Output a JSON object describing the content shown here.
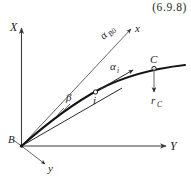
{
  "figure": {
    "equation_number": "(6.9.8)",
    "axes": [
      {
        "id": "X",
        "label": "X",
        "direction": "up",
        "type": "global"
      },
      {
        "id": "Y",
        "label": "Y",
        "direction": "right",
        "type": "global"
      },
      {
        "id": "y",
        "label": "y",
        "direction": "down-right",
        "type": "local"
      },
      {
        "id": "x",
        "label": "x",
        "direction": "up-right",
        "type": "local"
      }
    ],
    "points": [
      {
        "id": "B",
        "label": "B",
        "role": "origin"
      },
      {
        "id": "i",
        "label": "i",
        "role": "intermediate-node"
      },
      {
        "id": "C",
        "label": "C",
        "role": "end-node"
      }
    ],
    "angles": [
      {
        "id": "alpha_B0",
        "label": "α",
        "subscript": "B0",
        "between": "X-axis and local x-axis"
      },
      {
        "id": "beta",
        "label": "β",
        "subscript": "",
        "between": "local x-axis and chord B-i"
      },
      {
        "id": "alpha_i",
        "label": "α",
        "subscript": "i",
        "between": "tangent at i and local x-axis"
      }
    ],
    "vectors": [
      {
        "id": "r_C",
        "label": "r",
        "subscript": "C",
        "direction": "down",
        "anchor": "C"
      }
    ],
    "curve": {
      "id": "deflected-beam",
      "description": "curved beam from B to C"
    },
    "colors": {
      "background": "#ffffff",
      "curve": "#141414",
      "axis": "#3c3c3c",
      "thin": "#555555",
      "text": "#1e1e1e"
    }
  }
}
